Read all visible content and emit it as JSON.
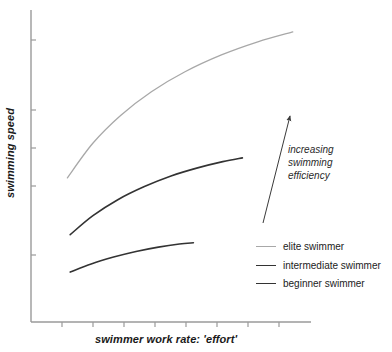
{
  "chart_data": {
    "type": "line",
    "title": "",
    "subtitle": "",
    "xlabel": "swimmer work rate: 'effort'",
    "ylabel": "swimming speed",
    "grid": false,
    "axis_ticks_labeled": false,
    "xlim": [
      0,
      10
    ],
    "ylim": [
      0,
      10
    ],
    "legend_position": "right-lower",
    "series": [
      {
        "name": "elite swimmer",
        "color": "#a8a8a8",
        "width": 1.3,
        "x": [
          1.3,
          2.2,
          3.2,
          4.3,
          5.5,
          6.8,
          8.1,
          9.35
        ],
        "y": [
          4.62,
          5.72,
          6.62,
          7.38,
          8.02,
          8.56,
          8.98,
          9.3
        ]
      },
      {
        "name": "intermediate swimmer",
        "color": "#333333",
        "width": 1.6,
        "x": [
          1.4,
          2.2,
          3.1,
          4.05,
          5.0,
          5.95,
          6.85,
          7.55
        ],
        "y": [
          2.8,
          3.4,
          3.92,
          4.34,
          4.68,
          4.94,
          5.14,
          5.26
        ]
      },
      {
        "name": "beginner swimmer",
        "color": "#333333",
        "width": 1.6,
        "x": [
          1.4,
          2.15,
          2.95,
          3.75,
          4.55,
          5.3,
          5.8
        ],
        "y": [
          1.6,
          1.86,
          2.08,
          2.26,
          2.4,
          2.5,
          2.54
        ]
      }
    ],
    "annotation": {
      "lines": [
        "increasing",
        "swimming",
        "efficiency"
      ],
      "arrow": {
        "from_px": [
          263,
          223
        ],
        "to_px": [
          290,
          116
        ],
        "color": "#3a3a3a"
      }
    },
    "axes": {
      "line_color": "#9a9a9a",
      "y_axis_x_px": 31,
      "y_axis_top_px": 10,
      "y_axis_bottom_px": 322,
      "x_axis_y_px": 322,
      "x_axis_left_px": 31,
      "x_axis_right_px": 311,
      "y_tick_y_px": [
        40,
        110,
        148,
        186,
        255
      ],
      "x_tick_x_px": [
        62,
        93,
        124,
        155,
        186,
        217,
        248,
        279
      ],
      "tick_length_px": 5
    }
  },
  "legend": {
    "items": [
      {
        "label": "elite swimmer",
        "color": "#a8a8a8"
      },
      {
        "label": "intermediate swimmer",
        "color": "#333333"
      },
      {
        "label": "beginner swimmer",
        "color": "#333333"
      }
    ]
  },
  "annotation_text": {
    "line1": "increasing",
    "line2": "swimming",
    "line3": "efficiency"
  }
}
